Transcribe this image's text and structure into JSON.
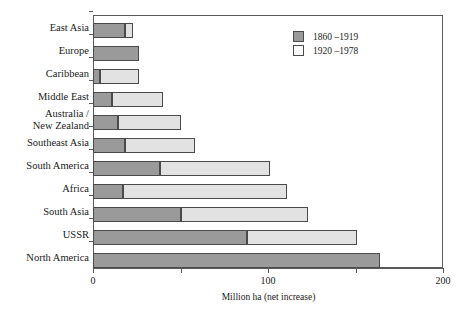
{
  "chart_data": {
    "type": "bar",
    "orientation": "horizontal",
    "stacked": true,
    "title": "",
    "xlabel": "Million ha (net increase)",
    "ylabel": "",
    "xlim": [
      0,
      200
    ],
    "xticks": [
      0,
      100,
      200
    ],
    "xtick_labels": [
      "0",
      "100",
      "200"
    ],
    "xminorticks": [
      50,
      150
    ],
    "grid": false,
    "legend_position": "top-right",
    "categories": [
      "East Asia",
      "Europe",
      "Caribbean",
      "Middle East",
      "Australia /\nNew Zealand",
      "Southeast Asia",
      "South America",
      "Africa",
      "South Asia",
      "USSR",
      "North America"
    ],
    "series": [
      {
        "name": "1860 – 1919",
        "color": "#9a9a9a",
        "values": [
          18,
          26,
          4,
          11,
          14,
          18,
          38,
          17,
          50,
          88,
          164
        ]
      },
      {
        "name": "1920 – 1978",
        "color": "#e2e2e2",
        "values": [
          5,
          0,
          22,
          29,
          36,
          40,
          63,
          94,
          73,
          63,
          0
        ]
      }
    ],
    "totals": [
      23,
      26,
      26,
      40,
      50,
      58,
      101,
      111,
      123,
      151,
      164
    ]
  },
  "legend": {
    "entries": [
      {
        "label": "1860 –1919",
        "swatch": "#9a9a9a"
      },
      {
        "label": "1920 –1978",
        "swatch": "#ffffff"
      }
    ]
  },
  "axis": {
    "x_title": "Million ha (net increase)",
    "tick_0": "0",
    "tick_1": "100",
    "tick_2": "200"
  }
}
